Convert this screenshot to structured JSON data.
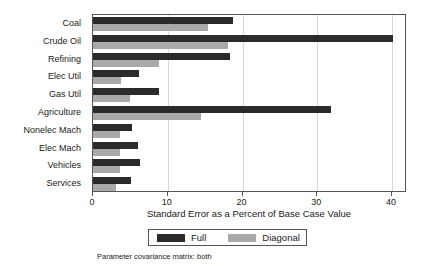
{
  "chart_data": {
    "type": "bar",
    "orientation": "horizontal",
    "title": "",
    "xlabel": "Standard Error as a Percent of Base Case Value",
    "ylabel": "",
    "xlim": [
      0,
      42
    ],
    "xticks": [
      0,
      10,
      20,
      30,
      40
    ],
    "xtick_labels": [
      "0",
      "10",
      "20",
      "30",
      "40"
    ],
    "grid": true,
    "legend_position": "below-axes",
    "categories": [
      "Coal",
      "Crude Oil",
      "Refining",
      "Elec Util",
      "Gas Util",
      "Agriculture",
      "Nonelec Mach",
      "Elec Mach",
      "Vehicles",
      "Services"
    ],
    "series": [
      {
        "name": "Full",
        "color": "#2b2b2b",
        "values": [
          18.7,
          40.1,
          18.3,
          6.1,
          8.8,
          31.9,
          5.2,
          6.0,
          6.3,
          5.1
        ]
      },
      {
        "name": "Diagonal",
        "color": "#a9a9a9",
        "values": [
          15.4,
          18.1,
          8.8,
          3.7,
          5.0,
          14.4,
          3.6,
          3.6,
          3.6,
          3.1
        ]
      }
    ],
    "caption": "Parameter covariance matrix: both"
  },
  "legend": {
    "items": [
      {
        "label": "Full",
        "swatch": "full"
      },
      {
        "label": "Diagonal",
        "swatch": "diag"
      }
    ]
  }
}
